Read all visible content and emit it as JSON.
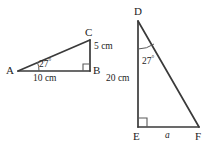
{
  "diagram": {
    "background_color": "#ffffff",
    "stroke_color": "#3a3a3a",
    "text_color": "#1c1c1c",
    "figures": [
      {
        "name": "triangle-abc",
        "vertices": [
          {
            "label": "A",
            "x": 18,
            "y": 71
          },
          {
            "label": "B",
            "x": 90,
            "y": 71
          },
          {
            "label": "C",
            "x": 90,
            "y": 40
          }
        ],
        "right_angle_at": "B",
        "angle_marks": [
          {
            "at": "A",
            "value": "27",
            "unit": "°"
          }
        ],
        "side_labels": [
          {
            "side": "AB",
            "text": "10 cm"
          },
          {
            "side": "CB",
            "text": "5 cm"
          }
        ]
      },
      {
        "name": "triangle-def",
        "vertices": [
          {
            "label": "D",
            "x": 138,
            "y": 21
          },
          {
            "label": "E",
            "x": 138,
            "y": 127
          },
          {
            "label": "F",
            "x": 199,
            "y": 127
          }
        ],
        "right_angle_at": "E",
        "angle_marks": [
          {
            "at": "D",
            "value": "27",
            "unit": "°"
          }
        ],
        "side_labels": [
          {
            "side": "DE",
            "text": "20 cm"
          },
          {
            "side": "EF",
            "text": "a"
          }
        ]
      }
    ]
  },
  "labels": {
    "a_vertex": "A",
    "b_vertex": "B",
    "c_vertex": "C",
    "d_vertex": "D",
    "e_vertex": "E",
    "f_vertex": "F",
    "angle_a_value": "27",
    "angle_a_unit": "°",
    "angle_d_value": "27",
    "angle_d_unit": "°",
    "side_ab": "10 cm",
    "side_cb": "5 cm",
    "side_de": "20 cm",
    "side_ef": "a"
  }
}
